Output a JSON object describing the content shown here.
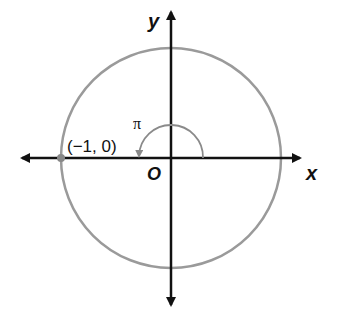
{
  "diagram": {
    "type": "unit-circle",
    "axes": {
      "x_label": "x",
      "y_label": "y",
      "origin_label": "O"
    },
    "point": {
      "label": "(−1, 0)",
      "x": -1,
      "y": 0
    },
    "angle": {
      "label": "π",
      "from_deg": 0,
      "to_deg": 180,
      "direction": "counterclockwise"
    },
    "colors": {
      "circle": "#9a9a9a",
      "axes": "#111111",
      "arc": "#8a8a8a",
      "point": "#888888",
      "text": "#111111"
    }
  }
}
